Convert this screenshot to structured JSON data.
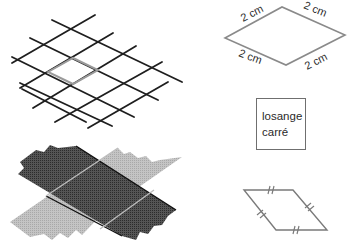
{
  "figure": {
    "grid": {
      "description": "isometric grid with highlighted rhombus",
      "line_color": "#1e1e1e",
      "highlight_color": "#9a9a9a"
    },
    "strips": {
      "description": "two overlapping paper strips forming a rhombus",
      "dark_color": "#4a4a4a",
      "light_color": "#bdbdbd"
    },
    "rhombus": {
      "side_labels": [
        "2 cm",
        "2 cm",
        "2 cm",
        "2 cm"
      ],
      "stroke_color": "#8a8a8a"
    },
    "label_box": {
      "line1": "losange",
      "line2": "carré"
    },
    "parallelogram": {
      "description": "rhombus with equal-side tick marks",
      "stroke_color": "#7a7a7a"
    }
  }
}
